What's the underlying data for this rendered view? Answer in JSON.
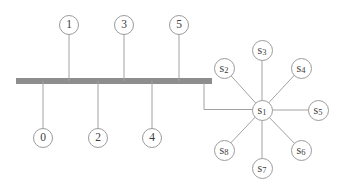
{
  "diagram": {
    "type": "network-topology",
    "colors": {
      "background": "#ffffff",
      "bus_bar": "#8d8d8d",
      "wire": "#a2a2a2",
      "circle_stroke": "#9b9b9b",
      "text": "#3d3d3d"
    }
  },
  "nodes": {
    "n0": {
      "label": "0"
    },
    "n1": {
      "label": "1"
    },
    "n2": {
      "label": "2"
    },
    "n3": {
      "label": "3"
    },
    "n4": {
      "label": "4"
    },
    "n5": {
      "label": "5"
    },
    "s1": {
      "base": "s",
      "sub": "1"
    },
    "s2": {
      "base": "s",
      "sub": "2"
    },
    "s3": {
      "base": "s",
      "sub": "3"
    },
    "s4": {
      "base": "s",
      "sub": "4"
    },
    "s5": {
      "base": "s",
      "sub": "5"
    },
    "s6": {
      "base": "s",
      "sub": "6"
    },
    "s7": {
      "base": "s",
      "sub": "7"
    },
    "s8": {
      "base": "s",
      "sub": "8"
    }
  },
  "structure": {
    "bus": {
      "attached_above": [
        "1",
        "3",
        "5"
      ],
      "attached_below": [
        "0",
        "2",
        "4"
      ],
      "right_end_connects_to": "s1"
    },
    "star": {
      "hub": "s1",
      "satellites": [
        "s2",
        "s3",
        "s4",
        "s5",
        "s6",
        "s7",
        "s8"
      ]
    }
  }
}
